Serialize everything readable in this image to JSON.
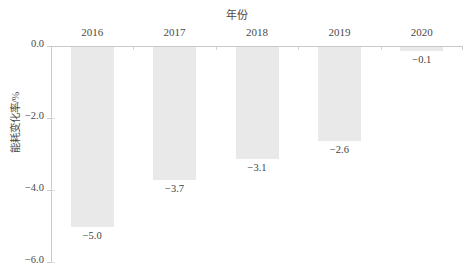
{
  "chart_data": {
    "type": "bar",
    "title": "年份",
    "subtitle": "",
    "xlabel": "",
    "ylabel": "能耗变化率/%",
    "categories": [
      "2016",
      "2017",
      "2018",
      "2019",
      "2020"
    ],
    "values": [
      -5.0,
      -3.7,
      -3.1,
      -2.6,
      -0.1
    ],
    "data_labels": [
      "−5.0",
      "−3.7",
      "−3.1",
      "−2.6",
      "−0.1"
    ],
    "ylim": [
      -6.0,
      0.0
    ],
    "yticks": [
      0.0,
      -2.0,
      -4.0,
      -6.0
    ],
    "ytick_labels": [
      "0.0",
      "−2.0",
      "−4.0",
      "−6.0"
    ],
    "grid": false,
    "legend": null,
    "legend_position": "none",
    "bar_color": "#e9e9e9",
    "axis_color": "#c9c9c9",
    "text_color": "#4a4a4a",
    "orientation": "vertical-downward"
  }
}
